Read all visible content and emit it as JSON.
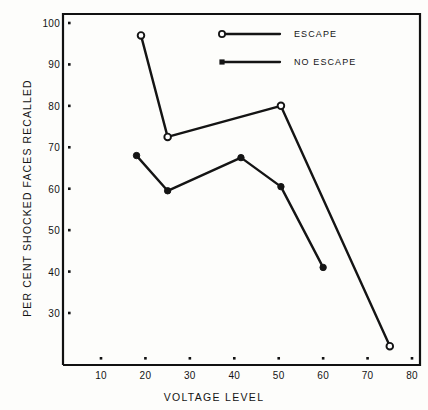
{
  "chart_data": {
    "type": "line",
    "title": "",
    "xlabel": "VOLTAGE  LEVEL",
    "ylabel": "PER CENT SHOCKED FACES RECALLED",
    "xlim": [
      5,
      85
    ],
    "ylim": [
      20,
      104
    ],
    "grid": false,
    "legend_position": "top-center",
    "xticks": [
      10,
      20,
      30,
      40,
      50,
      60,
      70,
      80
    ],
    "xtick_labels": [
      "10",
      "20",
      "30",
      "40",
      "50",
      "60",
      "70",
      "80"
    ],
    "yticks": [
      30,
      40,
      50,
      60,
      70,
      80,
      90,
      100
    ],
    "ytick_labels": [
      "30",
      "40",
      "50",
      "60",
      "70",
      "80",
      "90",
      "100"
    ],
    "series": [
      {
        "name": "ESCAPE",
        "marker": "open-circle",
        "x": [
          19,
          25,
          50.5,
          75
        ],
        "values": [
          97,
          72.5,
          80,
          22
        ]
      },
      {
        "name": "NO  ESCAPE",
        "marker": "filled-circle",
        "x": [
          18,
          25,
          41.5,
          50.5,
          60
        ],
        "values": [
          68,
          59.5,
          67.5,
          60.5,
          41
        ]
      }
    ]
  },
  "legend": {
    "entries": [
      {
        "label": "ESCAPE",
        "marker": "open-circle"
      },
      {
        "label": "NO  ESCAPE",
        "marker": "filled-circle"
      }
    ]
  },
  "colors": {
    "ink": "#141414",
    "background": "#fdfdfb",
    "axis": "#111111"
  }
}
